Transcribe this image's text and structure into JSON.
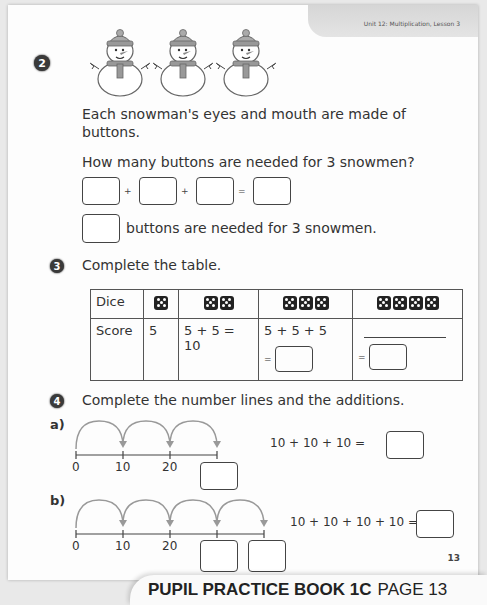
{
  "header": {
    "unit": "Unit 12: Multiplication, Lesson 3"
  },
  "q2": {
    "number": "2",
    "snowman_count": 3,
    "text_line1": "Each snowman's eyes and mouth are made of",
    "text_line2": "buttons.",
    "question": "How many buttons are needed for 3 snowmen?",
    "op_plus": "+",
    "op_equals": "=",
    "answer_sentence": "buttons are needed for 3 snowmen."
  },
  "q3": {
    "number": "3",
    "instruction": "Complete the table.",
    "table": {
      "row_headers": [
        "Dice",
        "Score"
      ],
      "columns": [
        {
          "dice": 1,
          "score": "5"
        },
        {
          "dice": 2,
          "score": "5 + 5 = 10"
        },
        {
          "dice": 3,
          "score": "5 + 5 + 5",
          "answer_prefix": "="
        },
        {
          "dice": 4,
          "score": "",
          "answer_prefix": "="
        }
      ]
    }
  },
  "q4": {
    "number": "4",
    "instruction": "Complete the number lines and the additions.",
    "a": {
      "label": "a)",
      "ticks": [
        "0",
        "10",
        "20"
      ],
      "equation": "10 + 10 + 10 ="
    },
    "b": {
      "label": "b)",
      "ticks": [
        "0",
        "10",
        "20"
      ],
      "equation": "10 + 10 + 10 + 10 ="
    }
  },
  "page_number": "13",
  "footer": {
    "book": "PUPIL PRACTICE BOOK 1C",
    "page": "PAGE 13"
  }
}
